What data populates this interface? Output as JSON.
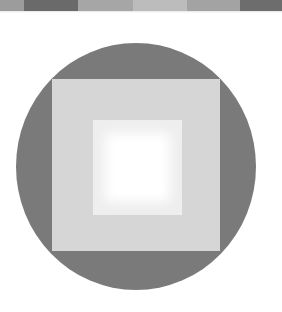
{
  "figure": {
    "top_strip": {
      "bands": [
        {
          "color": "#9c9c9c",
          "width": 24
        },
        {
          "color": "#6a6a6a",
          "width": 54
        },
        {
          "color": "#a6a6a6",
          "width": 55
        },
        {
          "color": "#bcbcbc",
          "width": 54
        },
        {
          "color": "#a3a3a3",
          "width": 53
        },
        {
          "color": "#6d6d6d",
          "width": 42
        }
      ]
    },
    "circle": {
      "color": "#7a7a7a"
    },
    "outer_square": {
      "color": "#d6d6d6"
    },
    "inner_square": {
      "color": "#eeeeee"
    },
    "inner_glow": {
      "color": "#ffffff"
    }
  }
}
